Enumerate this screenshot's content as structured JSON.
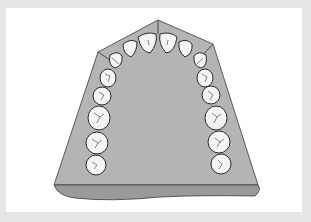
{
  "figure": {
    "colors": {
      "background": "#e6e6e6",
      "frame": "#ffffff",
      "base_top": "#b4b4b4",
      "base_side": "#9a9a9a",
      "tooth_fill": "#f4f4f4",
      "outline": "#2a2a2a"
    },
    "teeth": {
      "count": 14,
      "left": [
        "central-incisor",
        "lateral-incisor",
        "canine",
        "first-premolar",
        "second-premolar",
        "first-molar",
        "second-molar"
      ],
      "right": [
        "central-incisor",
        "lateral-incisor",
        "canine",
        "first-premolar",
        "second-premolar",
        "first-molar",
        "second-molar"
      ]
    }
  }
}
